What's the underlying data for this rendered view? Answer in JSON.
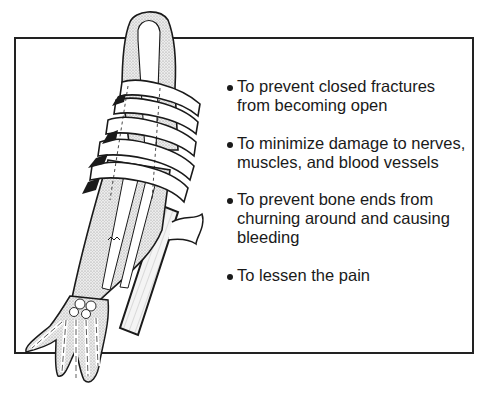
{
  "figure": {
    "illustration_icon": "splinted-arm-illustration",
    "colors": {
      "line": "#1a1a1a",
      "frame": "#222222",
      "shading": "#d6d6d6",
      "background": "#ffffff"
    }
  },
  "purposes": {
    "items": [
      {
        "line1": "To prevent closed fractures",
        "line2": "from becoming open",
        "line3": ""
      },
      {
        "line1": "To minimize damage to nerves,",
        "line2": "muscles, and blood vessels",
        "line3": ""
      },
      {
        "line1": "To prevent bone ends from",
        "line2": "churning around and causing",
        "line3": "bleeding"
      },
      {
        "line1": "To lessen the pain",
        "line2": "",
        "line3": ""
      }
    ]
  }
}
